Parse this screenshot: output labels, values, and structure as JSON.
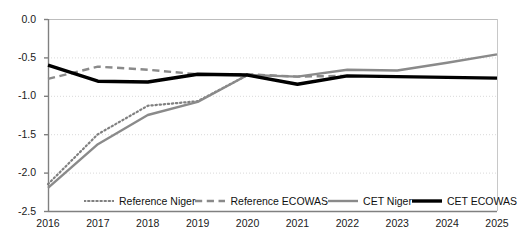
{
  "chart_data": {
    "type": "line",
    "title": "",
    "xlabel": "",
    "ylabel": "",
    "x": [
      2016,
      2017,
      2018,
      2019,
      2020,
      2021,
      2022,
      2023,
      2024,
      2025
    ],
    "xtick_labels": [
      "2016",
      "2017",
      "2018",
      "2019",
      "2020",
      "2021",
      "2022",
      "2023",
      "2024",
      "2025"
    ],
    "ytick_labels": [
      "0.0",
      "-0.5",
      "-1.0",
      "-1.5",
      "-2.0",
      "-2.5"
    ],
    "ytick_values": [
      0.0,
      -0.5,
      -1.0,
      -1.5,
      -2.0,
      -2.5
    ],
    "ylim": [
      -2.5,
      0.0
    ],
    "xlim": [
      2016,
      2025
    ],
    "grid": true,
    "grid_axis": "y",
    "legend_position": "bottom-inside",
    "series": [
      {
        "name": "Reference Niger",
        "style": "dotted",
        "color": "#808080",
        "width": 2.2,
        "x": [
          2016,
          2017,
          2018,
          2019,
          2020
        ],
        "values": [
          -2.15,
          -1.5,
          -1.13,
          -1.07,
          -0.73
        ]
      },
      {
        "name": "Reference ECOWAS",
        "style": "dashed",
        "color": "#8a8a8a",
        "width": 2.4,
        "x": [
          2016,
          2017,
          2018,
          2019,
          2020,
          2021,
          2022
        ],
        "values": [
          -0.78,
          -0.62,
          -0.66,
          -0.72,
          -0.72,
          -0.75,
          -0.74
        ]
      },
      {
        "name": "CET Niger",
        "style": "solid",
        "color": "#8a8a8a",
        "width": 2.4,
        "x": [
          2016,
          2017,
          2018,
          2019,
          2020,
          2021,
          2022,
          2023,
          2024,
          2025
        ],
        "values": [
          -2.2,
          -1.63,
          -1.25,
          -1.08,
          -0.73,
          -0.75,
          -0.66,
          -0.67,
          -0.57,
          -0.46
        ]
      },
      {
        "name": "CET ECOWAS",
        "style": "solid",
        "color": "#000000",
        "width": 3.4,
        "x": [
          2016,
          2017,
          2018,
          2019,
          2020,
          2021,
          2022,
          2023,
          2024,
          2025
        ],
        "values": [
          -0.6,
          -0.81,
          -0.82,
          -0.72,
          -0.73,
          -0.85,
          -0.74,
          -0.75,
          -0.76,
          -0.77
        ]
      }
    ]
  },
  "legend": {
    "items": [
      {
        "label": "Reference Niger",
        "style": "dotted",
        "color": "#808080"
      },
      {
        "label": "Reference ECOWAS",
        "style": "dashed",
        "color": "#8a8a8a"
      },
      {
        "label": "CET Niger",
        "style": "solid",
        "color": "#8a8a8a"
      },
      {
        "label": "CET ECOWAS",
        "style": "solid",
        "color": "#000000"
      }
    ]
  },
  "axes": {
    "axis_color": "#808080",
    "grid_color": "#d9d9d9",
    "tick_text_color": "#1a1a1a"
  }
}
